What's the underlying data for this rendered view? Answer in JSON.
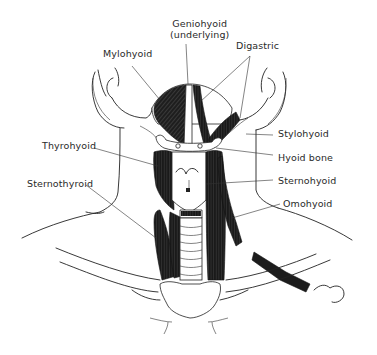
{
  "figure": {
    "labels": {
      "geniohyoid_line1": "Geniohyoid",
      "geniohyoid_line2": "(underlying)",
      "mylohyoid": "Mylohyoid",
      "digastric": "Digastric",
      "stylohyoid": "Stylohyoid",
      "hyoid_bone": "Hyoid bone",
      "thyrohyoid": "Thyrohyoid",
      "sternohyoid": "Sternohyoid",
      "sternothyroid": "Sternothyroid",
      "omohyoid": "Omohyoid"
    },
    "colors": {
      "ink": "#222222",
      "muscle": "#1c1c1c",
      "background": "#ffffff",
      "label_text": "#2a2a2a"
    }
  }
}
